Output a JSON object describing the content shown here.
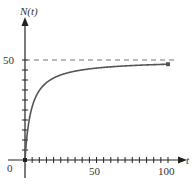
{
  "chart_data": {
    "type": "line",
    "title": "",
    "xlabel": "t",
    "ylabel": "N(t)",
    "xlim": [
      0,
      105
    ],
    "ylim": [
      -10,
      65
    ],
    "x_ticks": [
      0,
      50,
      100
    ],
    "y_ticks": [
      50
    ],
    "minor_tick_step_x": 5,
    "minor_tick_step_y": 5,
    "grid": false,
    "legend": null,
    "series": [
      {
        "name": "N(t)",
        "x": [
          0,
          1,
          2,
          3,
          5,
          7,
          10,
          15,
          20,
          30,
          40,
          50,
          60,
          70,
          80,
          90,
          100
        ],
        "values": [
          0,
          9.3,
          15.6,
          20.3,
          26.6,
          30.7,
          34.7,
          38.7,
          41.0,
          43.6,
          45.0,
          45.9,
          46.6,
          47.0,
          47.4,
          47.7,
          47.9
        ],
        "endpoint_marker": true
      }
    ],
    "annotations": [
      {
        "type": "hline",
        "y": 50,
        "style": "dashed",
        "label": "50"
      }
    ],
    "origin_label": "0"
  },
  "labels": {
    "y_axis": "N(t)",
    "x_axis": "t",
    "origin": "0",
    "y50": "50",
    "x50": "50",
    "x100": "100"
  },
  "colors": {
    "axis": "#222222",
    "curve": "#555555",
    "dashed": "#777777",
    "text": "#333333"
  }
}
